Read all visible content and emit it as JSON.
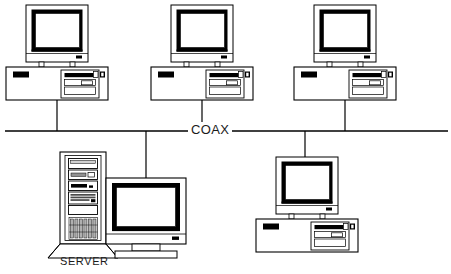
{
  "diagram": {
    "bus": {
      "label": "COAX",
      "orientation": "horizontal",
      "y": 131,
      "x_start": 5,
      "x_end": 448,
      "color": "#000000"
    },
    "nodes": [
      {
        "id": "workstation-1",
        "type": "desktop-pc",
        "label": "",
        "position": "top-left",
        "x": 12,
        "y": 8,
        "drop_line_x": 57,
        "drop_line_from_y": 98,
        "drop_line_to_y": 131
      },
      {
        "id": "workstation-2",
        "type": "desktop-pc",
        "label": "",
        "position": "top-center",
        "x": 157,
        "y": 8,
        "drop_line_x": 202,
        "drop_line_from_y": 98,
        "drop_line_to_y": 131
      },
      {
        "id": "workstation-3",
        "type": "desktop-pc",
        "label": "",
        "position": "top-right",
        "x": 300,
        "y": 8,
        "drop_line_x": 345,
        "drop_line_from_y": 98,
        "drop_line_to_y": 131
      },
      {
        "id": "server",
        "type": "tower-server",
        "label": "SERVER",
        "position": "bottom-left",
        "x": 52,
        "y": 152,
        "drop_line_x": 146,
        "drop_line_from_y": 131,
        "drop_line_to_y": 178
      },
      {
        "id": "workstation-4",
        "type": "desktop-pc",
        "label": "",
        "position": "bottom-right",
        "x": 262,
        "y": 155,
        "drop_line_x": 305,
        "drop_line_from_y": 131,
        "drop_line_to_y": 163
      }
    ],
    "colors": {
      "line": "#000000",
      "bezel": "#000000",
      "screen": "#ffffff",
      "case_fill": "#ffffff",
      "accent_dark": "#1a1a1a",
      "vent_fill": "#b8b8b8",
      "text": "#1b1b1b"
    },
    "counts": {
      "workstations": 4,
      "servers": 1,
      "total_nodes": 5
    }
  }
}
